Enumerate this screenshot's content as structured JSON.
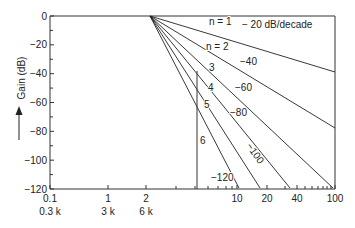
{
  "chart_data": {
    "type": "line",
    "title": "",
    "subtitle": "Butterworth low-pass filter attenuation vs. normalized frequency",
    "xlabel": "",
    "ylabel": "Gain (dB)",
    "x_scale": "log",
    "ylim": [
      -120,
      0
    ],
    "xlim": [
      0.1,
      100
    ],
    "grid": false,
    "x_ticks": [
      {
        "value": 0.1,
        "label": "0.1",
        "sublabel": "0.3 k",
        "px": 50
      },
      {
        "value": 1,
        "label": "1",
        "sublabel": "3 k",
        "px": 108
      },
      {
        "value": 2,
        "label": "2",
        "sublabel": "6 k",
        "px": 146
      },
      {
        "value": 10,
        "label": "10",
        "sublabel": "",
        "px": 237
      },
      {
        "value": 20,
        "label": "20",
        "sublabel": "",
        "px": 267
      },
      {
        "value": 40,
        "label": "40",
        "sublabel": "",
        "px": 297
      },
      {
        "value": 100,
        "label": "100",
        "sublabel": "",
        "px": 335
      }
    ],
    "y_ticks": [
      0,
      -20,
      -40,
      -60,
      -80,
      -100,
      -120
    ],
    "y_tick_labels": [
      "0",
      "−20",
      "−40",
      "−60",
      "−80",
      "−100",
      "−120"
    ],
    "knee": {
      "x": 2,
      "y": 0
    },
    "series": [
      {
        "name": "n = 1",
        "order": 1,
        "slope_db_per_decade": -20,
        "slope_label": "− 20 dB/decade",
        "end_px": [
          335,
          72
        ]
      },
      {
        "name": "n = 2",
        "order": 2,
        "slope_db_per_decade": -40,
        "slope_label": "−40",
        "end_px": [
          335,
          128
        ]
      },
      {
        "name": "3",
        "order": 3,
        "slope_db_per_decade": -60,
        "slope_label": "−60",
        "end_px": [
          333,
          188
        ]
      },
      {
        "name": "4",
        "order": 4,
        "slope_db_per_decade": -80,
        "slope_label": "−80",
        "end_px": [
          290,
          188
        ]
      },
      {
        "name": "5",
        "order": 5,
        "slope_db_per_decade": -100,
        "slope_label": "−100",
        "end_px": [
          260,
          188
        ]
      },
      {
        "name": "6",
        "order": 6,
        "slope_db_per_decade": -120,
        "slope_label": "−120",
        "end_px": [
          239,
          188
        ]
      }
    ],
    "annotations": [
      {
        "text": "n = 1",
        "x": 209,
        "y": 25
      },
      {
        "text": "− 20 dB/decade",
        "x": 242,
        "y": 28
      },
      {
        "text": "n = 2",
        "x": 206,
        "y": 50
      },
      {
        "text": "3",
        "x": 209,
        "y": 71
      },
      {
        "text": "−40",
        "x": 240,
        "y": 65
      },
      {
        "text": "4",
        "x": 208,
        "y": 91
      },
      {
        "text": "−60",
        "x": 235,
        "y": 91
      },
      {
        "text": "5",
        "x": 204,
        "y": 108
      },
      {
        "text": "−80",
        "x": 230,
        "y": 116
      },
      {
        "text": "6",
        "x": 200,
        "y": 144
      },
      {
        "text": "−100",
        "x": 246,
        "y": 146,
        "rotate": 55
      },
      {
        "text": "−120",
        "x": 211,
        "y": 181
      }
    ],
    "marker_line": {
      "x_px": 197,
      "y_top_px": 71,
      "y_bottom_px": 189
    }
  },
  "axis": {
    "ylabel": "Gain (dB)"
  }
}
